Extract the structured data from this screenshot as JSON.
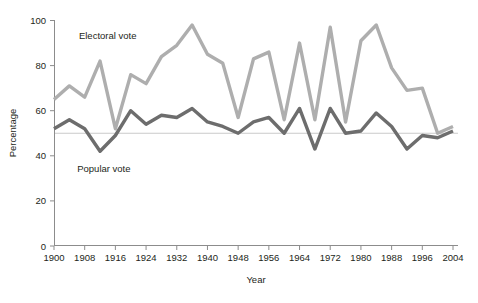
{
  "chart_data": {
    "type": "line",
    "title": "",
    "xlabel": "Year",
    "ylabel": "Percentage",
    "xlim": [
      1900,
      2004
    ],
    "ylim": [
      0,
      100
    ],
    "grid": false,
    "legend_position": "inline-annotation",
    "x_tick_labels": [
      "1900",
      "1908",
      "1916",
      "1924",
      "1932",
      "1940",
      "1948",
      "1956",
      "1964",
      "1972",
      "1980",
      "1988",
      "1996",
      "2004"
    ],
    "x_tick_values": [
      1900,
      1908,
      1916,
      1924,
      1932,
      1940,
      1948,
      1956,
      1964,
      1972,
      1980,
      1988,
      1996,
      2004
    ],
    "y_tick_labels": [
      "0",
      "20",
      "40",
      "60",
      "80",
      "100"
    ],
    "y_tick_values": [
      0,
      20,
      40,
      60,
      80,
      100
    ],
    "reference_line": {
      "value": 50,
      "label": ""
    },
    "x": [
      1900,
      1904,
      1908,
      1912,
      1916,
      1920,
      1924,
      1928,
      1932,
      1936,
      1940,
      1944,
      1948,
      1952,
      1956,
      1960,
      1964,
      1968,
      1972,
      1976,
      1980,
      1984,
      1988,
      1992,
      1996,
      2000,
      2004
    ],
    "series": [
      {
        "name": "Electoral vote",
        "color": "#aeaeae",
        "values": [
          65,
          71,
          66,
          82,
          52,
          76,
          72,
          84,
          89,
          98,
          85,
          81,
          57,
          83,
          86,
          56,
          90,
          56,
          97,
          55,
          91,
          98,
          79,
          69,
          70,
          50,
          53
        ]
      },
      {
        "name": "Popular vote",
        "color": "#6d6d6d",
        "values": [
          52,
          56,
          52,
          42,
          49,
          60,
          54,
          58,
          57,
          61,
          55,
          53,
          50,
          55,
          57,
          50,
          61,
          43,
          61,
          50,
          51,
          59,
          53,
          43,
          49,
          48,
          51
        ]
      }
    ],
    "annotations": [
      {
        "text": "Electoral vote",
        "x": 1914,
        "y": 92
      },
      {
        "text": "Popular vote",
        "x": 1913,
        "y": 33
      }
    ]
  },
  "axes": {
    "x_axis_title": "Year",
    "y_axis_title": "Percentage"
  }
}
